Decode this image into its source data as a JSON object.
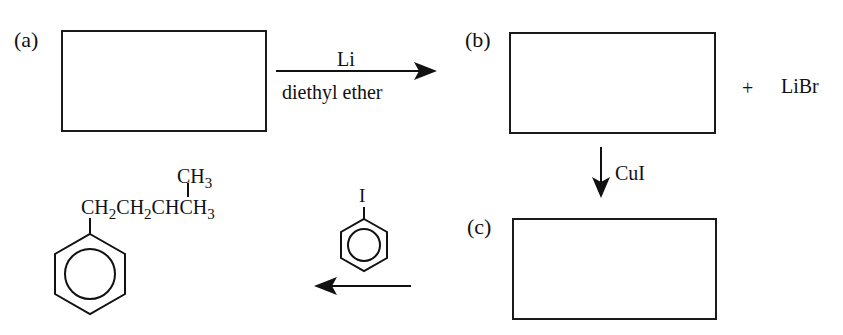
{
  "diagram": {
    "type": "reaction-scheme",
    "steps": {
      "a": {
        "label": "(a)",
        "content": ""
      },
      "b": {
        "label": "(b)",
        "content": ""
      },
      "c": {
        "label": "(c)",
        "content": ""
      }
    },
    "arrow_a_to_b": {
      "reagent_top": "Li",
      "reagent_bottom": "diethyl ether"
    },
    "byproduct": {
      "plus": "+",
      "name": "LiBr"
    },
    "arrow_b_to_c": {
      "reagent": "CuI"
    },
    "arrow_c_to_product": {
      "reagent_substituent": "I",
      "reagent_name": "iodobenzene"
    },
    "product": {
      "branch": "CH3",
      "chain_parts": [
        "CH",
        "2",
        "CH",
        "2",
        "CHCH",
        "3"
      ],
      "branch_parts": [
        "CH",
        "3"
      ],
      "ring": "benzene"
    }
  }
}
